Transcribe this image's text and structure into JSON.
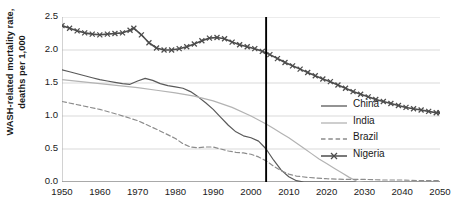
{
  "chart_data": {
    "type": "line",
    "title": "",
    "xlabel": "",
    "ylabel": "WASH-related mortality rate, deaths per 1,000",
    "ylabel_line1": "WASH-related mortality rate,",
    "ylabel_line2": "deaths per 1,000",
    "xlim": [
      1950,
      2050
    ],
    "ylim": [
      0.0,
      2.5
    ],
    "ytick_labels": [
      "0.0",
      "0.5",
      "1.0",
      "1.5",
      "2.0",
      "2.5"
    ],
    "ytick_values": [
      0.0,
      0.5,
      1.0,
      1.5,
      2.0,
      2.5
    ],
    "xtick_labels": [
      "1950",
      "1960",
      "1970",
      "1980",
      "1990",
      "2000",
      "2010",
      "2020",
      "2030",
      "2040",
      "2050"
    ],
    "xtick_values": [
      1950,
      1960,
      1970,
      1980,
      1990,
      2000,
      2010,
      2020,
      2030,
      2040,
      2050
    ],
    "xminor_step": 2,
    "grid": "horizontal",
    "legend_position": "inside-right",
    "annotations": [
      {
        "name": "present-year-divider",
        "type": "vline",
        "x": 2004,
        "label": ""
      }
    ],
    "series": [
      {
        "name": "China",
        "style": "solid",
        "color": "#595959",
        "marker": "none",
        "x": [
          1950,
          1952,
          1954,
          1956,
          1958,
          1960,
          1962,
          1964,
          1966,
          1968,
          1970,
          1972,
          1974,
          1976,
          1978,
          1980,
          1982,
          1984,
          1986,
          1988,
          1990,
          1992,
          1994,
          1996,
          1998,
          2000,
          2002,
          2004,
          2006,
          2008,
          2010,
          2012,
          2014,
          2016,
          2018,
          2020,
          2025,
          2030,
          2035,
          2040,
          2045,
          2050
        ],
        "y": [
          1.7,
          1.67,
          1.64,
          1.61,
          1.58,
          1.55,
          1.53,
          1.51,
          1.49,
          1.48,
          1.53,
          1.57,
          1.54,
          1.49,
          1.46,
          1.44,
          1.42,
          1.37,
          1.29,
          1.2,
          1.1,
          0.98,
          0.86,
          0.76,
          0.7,
          0.67,
          0.62,
          0.5,
          0.33,
          0.18,
          0.08,
          0.02,
          0.0,
          0.0,
          0.0,
          0.0,
          0.0,
          0.0,
          0.0,
          0.0,
          0.0,
          0.0
        ]
      },
      {
        "name": "India",
        "style": "solid",
        "color": "#b3b3b3",
        "marker": "none",
        "x": [
          1950,
          1955,
          1960,
          1965,
          1970,
          1975,
          1980,
          1985,
          1990,
          1995,
          2000,
          2002,
          2004,
          2006,
          2008,
          2010,
          2012,
          2014,
          2016,
          2018,
          2020,
          2022,
          2024,
          2026,
          2028,
          2030,
          2035,
          2040,
          2045,
          2050
        ],
        "y": [
          1.55,
          1.52,
          1.49,
          1.46,
          1.43,
          1.39,
          1.35,
          1.3,
          1.23,
          1.13,
          1.0,
          0.94,
          0.88,
          0.81,
          0.74,
          0.67,
          0.59,
          0.51,
          0.43,
          0.35,
          0.28,
          0.21,
          0.14,
          0.07,
          0.01,
          0.0,
          0.0,
          0.0,
          0.0,
          0.0
        ]
      },
      {
        "name": "Brazil",
        "style": "dashed",
        "color": "#8c8c8c",
        "marker": "none",
        "x": [
          1950,
          1955,
          1960,
          1965,
          1970,
          1975,
          1980,
          1982,
          1984,
          1986,
          1988,
          1990,
          1992,
          1994,
          1996,
          1998,
          2000,
          2002,
          2004,
          2006,
          2008,
          2010,
          2012,
          2015,
          2020,
          2025,
          2030,
          2035,
          2040,
          2045,
          2050
        ],
        "y": [
          1.22,
          1.16,
          1.1,
          1.02,
          0.93,
          0.8,
          0.66,
          0.58,
          0.53,
          0.52,
          0.53,
          0.53,
          0.5,
          0.47,
          0.45,
          0.44,
          0.42,
          0.38,
          0.32,
          0.24,
          0.17,
          0.12,
          0.09,
          0.07,
          0.05,
          0.04,
          0.04,
          0.03,
          0.03,
          0.02,
          0.02
        ]
      },
      {
        "name": "Nigeria",
        "style": "solid",
        "color": "#4d4d4d",
        "marker": "x",
        "x": [
          1950,
          1952,
          1954,
          1956,
          1958,
          1960,
          1962,
          1964,
          1966,
          1968,
          1969,
          1971,
          1973,
          1975,
          1977,
          1979,
          1981,
          1983,
          1985,
          1987,
          1989,
          1991,
          1993,
          1995,
          1997,
          1999,
          2001,
          2003,
          2005,
          2007,
          2009,
          2011,
          2013,
          2015,
          2017,
          2019,
          2021,
          2023,
          2025,
          2027,
          2029,
          2031,
          2033,
          2035,
          2037,
          2039,
          2041,
          2043,
          2045,
          2047,
          2049,
          2050
        ],
        "y": [
          2.37,
          2.33,
          2.29,
          2.26,
          2.24,
          2.23,
          2.24,
          2.25,
          2.26,
          2.3,
          2.33,
          2.23,
          2.11,
          2.03,
          2.0,
          2.0,
          2.02,
          2.05,
          2.09,
          2.14,
          2.18,
          2.19,
          2.17,
          2.12,
          2.08,
          2.05,
          2.02,
          1.98,
          1.93,
          1.87,
          1.81,
          1.76,
          1.71,
          1.66,
          1.61,
          1.56,
          1.52,
          1.47,
          1.42,
          1.37,
          1.33,
          1.29,
          1.25,
          1.22,
          1.19,
          1.16,
          1.13,
          1.11,
          1.09,
          1.07,
          1.05,
          1.05
        ]
      }
    ]
  },
  "legend": {
    "items": [
      {
        "label": "China"
      },
      {
        "label": "India"
      },
      {
        "label": "Brazil"
      },
      {
        "label": "Nigeria"
      }
    ]
  }
}
